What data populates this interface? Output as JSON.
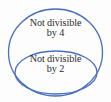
{
  "diagram": {
    "type": "nested-set-euler-diagram",
    "background_color": "#fdfdfd",
    "stroke_color": "#4a6fbf",
    "text_color": "#2b2b2b",
    "outer_set": {
      "name": "not-divisible-by-4",
      "line1": "Not divisible",
      "line2": "by 4",
      "shape": "ellipse",
      "center_x": 55.5,
      "center_y": 52.5,
      "radius_x": 47,
      "radius_y": 43.5
    },
    "inner_set": {
      "name": "not-divisible-by-2",
      "line1": "Not divisible",
      "line2": "by 2",
      "shape": "ellipse",
      "center_x": 56,
      "center_y": 72.5,
      "radius_x": 41,
      "radius_y": 21.5
    }
  }
}
